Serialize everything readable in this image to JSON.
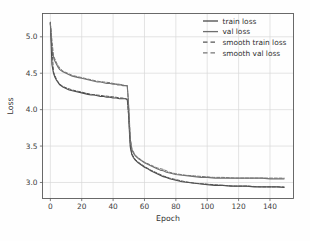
{
  "chart_data": {
    "type": "line",
    "title": "",
    "xlabel": "Epoch",
    "ylabel": "Loss",
    "xlim": [
      -5,
      155
    ],
    "ylim": [
      2.78,
      5.32
    ],
    "xticks": [
      0,
      20,
      40,
      60,
      80,
      100,
      120,
      140
    ],
    "xticklabels": [
      "0",
      "20",
      "40",
      "60",
      "80",
      "100",
      "120",
      "140"
    ],
    "yticks": [
      3.0,
      3.5,
      4.0,
      4.5,
      5.0
    ],
    "yticklabels": [
      "3.0",
      "3.5",
      "4.0",
      "4.5",
      "5.0"
    ],
    "grid": true,
    "legend_position": "upper right",
    "colors": {
      "train_loss": "#4a4a4a",
      "val_loss": "#6e6e6e",
      "smooth_train_loss": "#555555",
      "smooth_val_loss": "#767676",
      "grid": "#d8d8d8",
      "axis": "#5a5a5a",
      "background": "#fefefe"
    },
    "series": [
      {
        "name": "train loss",
        "style": "solid",
        "color": "#4a4a4a",
        "x": [
          0,
          1,
          2,
          3,
          4,
          5,
          6,
          8,
          10,
          12,
          14,
          16,
          18,
          20,
          22,
          24,
          26,
          28,
          30,
          32,
          34,
          36,
          38,
          40,
          42,
          44,
          45,
          46,
          47,
          48,
          49,
          49.5,
          50,
          50.5,
          51,
          52,
          53,
          54,
          55,
          56,
          58,
          60,
          62,
          64,
          66,
          68,
          70,
          72,
          74,
          76,
          78,
          80,
          84,
          88,
          92,
          96,
          100,
          105,
          110,
          115,
          120,
          125,
          130,
          135,
          140,
          145,
          149
        ],
        "y": [
          5.2,
          4.62,
          4.5,
          4.44,
          4.4,
          4.37,
          4.34,
          4.31,
          4.29,
          4.27,
          4.26,
          4.25,
          4.24,
          4.23,
          4.22,
          4.21,
          4.2,
          4.2,
          4.19,
          4.18,
          4.18,
          4.17,
          4.17,
          4.16,
          4.16,
          4.15,
          4.15,
          4.15,
          4.15,
          4.15,
          4.14,
          4.06,
          3.88,
          3.65,
          3.48,
          3.38,
          3.34,
          3.31,
          3.29,
          3.27,
          3.24,
          3.21,
          3.19,
          3.16,
          3.14,
          3.12,
          3.1,
          3.08,
          3.07,
          3.05,
          3.04,
          3.03,
          3.01,
          3.0,
          2.99,
          2.98,
          2.97,
          2.96,
          2.96,
          2.95,
          2.95,
          2.95,
          2.94,
          2.94,
          2.94,
          2.94,
          2.93
        ]
      },
      {
        "name": "val loss",
        "style": "solid",
        "color": "#6e6e6e",
        "x": [
          0,
          1,
          2,
          3,
          4,
          5,
          6,
          8,
          10,
          12,
          14,
          16,
          18,
          20,
          22,
          24,
          26,
          28,
          30,
          32,
          34,
          36,
          38,
          40,
          42,
          43,
          44,
          45,
          46,
          47,
          48,
          49,
          49.5,
          50,
          50.5,
          51,
          52,
          53,
          54,
          55,
          56,
          58,
          60,
          62,
          64,
          66,
          68,
          70,
          72,
          74,
          76,
          78,
          80,
          84,
          88,
          92,
          96,
          100,
          105,
          110,
          115,
          120,
          125,
          130,
          135,
          140,
          145,
          149
        ],
        "y": [
          5.2,
          4.82,
          4.72,
          4.66,
          4.62,
          4.58,
          4.55,
          4.52,
          4.5,
          4.48,
          4.46,
          4.45,
          4.44,
          4.43,
          4.42,
          4.41,
          4.4,
          4.39,
          4.38,
          4.38,
          4.37,
          4.36,
          4.36,
          4.35,
          4.35,
          4.34,
          4.34,
          4.34,
          4.33,
          4.33,
          4.33,
          4.33,
          4.2,
          4.0,
          3.76,
          3.58,
          3.45,
          3.4,
          3.37,
          3.35,
          3.33,
          3.3,
          3.27,
          3.25,
          3.23,
          3.21,
          3.19,
          3.17,
          3.16,
          3.14,
          3.13,
          3.12,
          3.11,
          3.1,
          3.09,
          3.08,
          3.07,
          3.07,
          3.06,
          3.06,
          3.06,
          3.06,
          3.06,
          3.06,
          3.06,
          3.05,
          3.05,
          3.05
        ]
      },
      {
        "name": "smooth train loss",
        "style": "dashed",
        "color": "#555555",
        "x": [
          0,
          2,
          4,
          6,
          8,
          10,
          14,
          18,
          22,
          26,
          30,
          34,
          38,
          42,
          44,
          46,
          48,
          49,
          50,
          51,
          52,
          54,
          56,
          58,
          60,
          64,
          68,
          72,
          76,
          80,
          86,
          92,
          98,
          104,
          110,
          118,
          126,
          134,
          142,
          149
        ],
        "y": [
          5.18,
          4.52,
          4.41,
          4.35,
          4.32,
          4.3,
          4.27,
          4.25,
          4.23,
          4.21,
          4.2,
          4.19,
          4.18,
          4.17,
          4.16,
          4.16,
          4.15,
          4.14,
          3.9,
          3.5,
          3.39,
          3.32,
          3.28,
          3.25,
          3.22,
          3.17,
          3.13,
          3.09,
          3.06,
          3.04,
          3.01,
          2.99,
          2.98,
          2.97,
          2.96,
          2.95,
          2.95,
          2.94,
          2.94,
          2.94
        ]
      },
      {
        "name": "smooth val loss",
        "style": "dashed",
        "color": "#767676",
        "x": [
          0,
          2,
          4,
          6,
          8,
          10,
          14,
          18,
          22,
          26,
          30,
          34,
          38,
          42,
          44,
          46,
          48,
          49,
          50,
          51,
          52,
          54,
          56,
          58,
          60,
          64,
          68,
          72,
          76,
          80,
          86,
          92,
          98,
          104,
          110,
          118,
          126,
          134,
          142,
          149
        ],
        "y": [
          5.18,
          4.74,
          4.64,
          4.57,
          4.53,
          4.51,
          4.47,
          4.45,
          4.43,
          4.41,
          4.39,
          4.38,
          4.37,
          4.35,
          4.35,
          4.34,
          4.33,
          4.33,
          4.03,
          3.6,
          3.46,
          3.38,
          3.34,
          3.31,
          3.28,
          3.24,
          3.2,
          3.18,
          3.14,
          3.12,
          3.1,
          3.09,
          3.08,
          3.07,
          3.07,
          3.06,
          3.06,
          3.06,
          3.06,
          3.06
        ]
      }
    ],
    "legend": [
      {
        "label": "train loss",
        "style": "solid",
        "color": "#4a4a4a"
      },
      {
        "label": "val loss",
        "style": "solid",
        "color": "#6e6e6e"
      },
      {
        "label": "smooth train loss",
        "style": "dashed",
        "color": "#555555"
      },
      {
        "label": "smooth val loss",
        "style": "dashed",
        "color": "#767676"
      }
    ]
  }
}
